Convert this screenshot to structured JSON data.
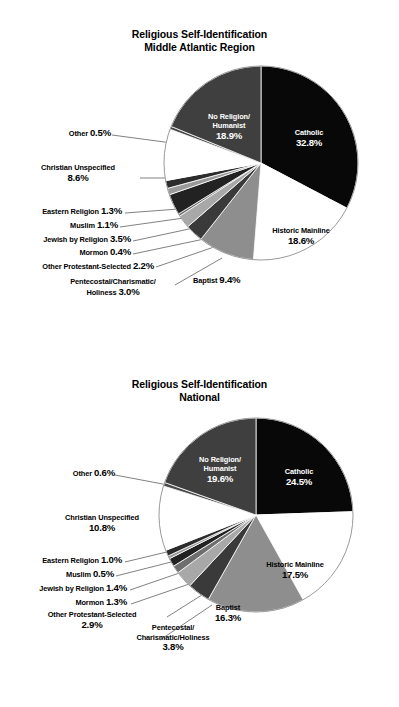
{
  "charts": [
    {
      "title_line1": "Religious Self-Identification",
      "title_line2": "Middle Atlantic Region",
      "labels": {
        "catholic": "Catholic",
        "catholic_pct": "32.8%",
        "no_religion_l1": "No Religion/",
        "no_religion_l2": "Humanist",
        "no_religion_pct": "18.9%",
        "historic_mainline": "Historic Mainline",
        "historic_mainline_pct": "18.6%",
        "baptist": "Baptist",
        "baptist_pct": "9.4%",
        "other": "Other",
        "other_pct": "0.5%",
        "christian_unspecified": "Christian Unspecified",
        "christian_unspecified_pct": "8.6%",
        "eastern_religion": "Eastern Religion",
        "eastern_religion_pct": "1.3%",
        "muslim": "Muslim",
        "muslim_pct": "1.1%",
        "jewish": "Jewish by Religion",
        "jewish_pct": "3.5%",
        "mormon": "Mormon",
        "mormon_pct": "0.4%",
        "other_protestant": "Other Protestant-Selected",
        "other_protestant_pct": "2.2%",
        "pentecostal_l1": "Pentecostal/Charismatic/",
        "pentecostal_l2": "Holiness",
        "pentecostal_pct": "3.0%"
      }
    },
    {
      "title_line1": "Religious Self-Identification",
      "title_line2": "National",
      "labels": {
        "catholic": "Catholic",
        "catholic_pct": "24.5%",
        "no_religion_l1": "No Religion/",
        "no_religion_l2": "Humanist",
        "no_religion_pct": "19.6%",
        "historic_mainline": "Historic Mainline",
        "historic_mainline_pct": "17.5%",
        "baptist": "Baptist",
        "baptist_pct": "16.3%",
        "other": "Other",
        "other_pct": "0.6%",
        "christian_unspecified": "Christian Unspecified",
        "christian_unspecified_pct": "10.8%",
        "eastern_religion": "Eastern Religion",
        "eastern_religion_pct": "1.0%",
        "muslim": "Muslim",
        "muslim_pct": "0.5%",
        "jewish": "Jewish by Religion",
        "jewish_pct": "1.4%",
        "mormon": "Mormon",
        "mormon_pct": "1.3%",
        "other_protestant": "Other Protestant-Selected",
        "other_protestant_pct": "2.9%",
        "pentecostal_l1": "Pentecostal/",
        "pentecostal_l2": "Charismatic/Holiness",
        "pentecostal_pct": "3.8%"
      }
    }
  ],
  "chart_data": [
    {
      "type": "pie",
      "title": "Religious Self-Identification Middle Atlantic Region",
      "categories": [
        "Catholic",
        "Historic Mainline",
        "Baptist",
        "Pentecostal/Charismatic/Holiness",
        "Other Protestant-Selected",
        "Mormon",
        "Jewish by Religion",
        "Muslim",
        "Eastern Religion",
        "Christian Unspecified",
        "Other",
        "No Religion/Humanist"
      ],
      "values": [
        32.8,
        18.6,
        9.4,
        3.0,
        2.2,
        0.4,
        3.5,
        1.1,
        1.3,
        8.6,
        0.5,
        18.9
      ],
      "colors": [
        "#080808",
        "#ffffff",
        "#8e8e8e",
        "#3a3a3a",
        "#a8a8a8",
        "#6e6e6e",
        "#222222",
        "#9a9a9a",
        "#2c2c2c",
        "#ffffff",
        "#4a4a4a",
        "#3f3f3f"
      ],
      "legend": "none",
      "units": "percent",
      "labels_inside": [
        "Catholic",
        "Historic Mainline",
        "Baptist",
        "No Religion/Humanist"
      ],
      "labels_outside": [
        "Other",
        "Christian Unspecified",
        "Eastern Religion",
        "Muslim",
        "Jewish by Religion",
        "Mormon",
        "Other Protestant-Selected",
        "Pentecostal/Charismatic/Holiness"
      ]
    },
    {
      "type": "pie",
      "title": "Religious Self-Identification National",
      "categories": [
        "Catholic",
        "Historic Mainline",
        "Baptist",
        "Pentecostal/Charismatic/Holiness",
        "Other Protestant-Selected",
        "Mormon",
        "Jewish by Religion",
        "Muslim",
        "Eastern Religion",
        "Christian Unspecified",
        "Other",
        "No Religion/Humanist"
      ],
      "values": [
        24.5,
        17.5,
        16.3,
        3.8,
        2.9,
        1.3,
        1.4,
        0.5,
        1.0,
        10.8,
        0.6,
        19.6
      ],
      "colors": [
        "#080808",
        "#ffffff",
        "#8e8e8e",
        "#3a3a3a",
        "#a8a8a8",
        "#6e6e6e",
        "#222222",
        "#9a9a9a",
        "#2c2c2c",
        "#ffffff",
        "#4a4a4a",
        "#3f3f3f"
      ],
      "legend": "none",
      "units": "percent",
      "labels_inside": [
        "Catholic",
        "Historic Mainline",
        "Baptist",
        "No Religion/Humanist"
      ],
      "labels_outside": [
        "Other",
        "Christian Unspecified",
        "Eastern Religion",
        "Muslim",
        "Jewish by Religion",
        "Mormon",
        "Other Protestant-Selected",
        "Pentecostal/Charismatic/Holiness"
      ]
    }
  ]
}
